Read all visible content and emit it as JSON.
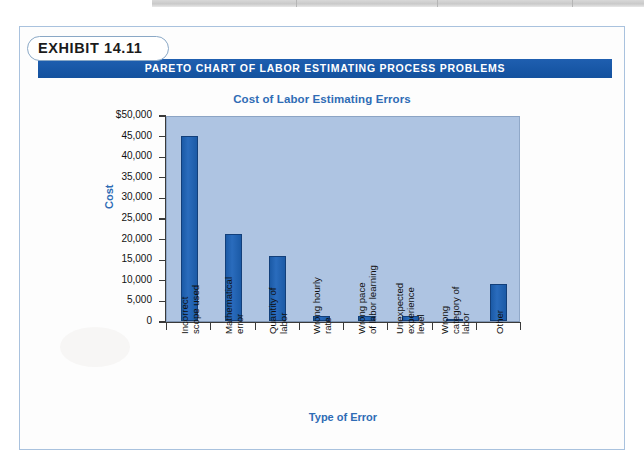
{
  "exhibit": {
    "label": "EXHIBIT 14.11",
    "banner_title": "PARETO CHART OF LABOR ESTIMATING PROCESS PROBLEMS",
    "banner_color": "#1857a6",
    "accent_color": "#2f6cb5"
  },
  "chart_data": {
    "type": "bar",
    "title": "Cost of Labor Estimating Errors",
    "xlabel": "Type of Error",
    "ylabel": "Cost",
    "ylim": [
      0,
      50000
    ],
    "ytick_labels": [
      "$50,000",
      "45,000",
      "40,000",
      "35,000",
      "30,000",
      "25,000",
      "20,000",
      "15,000",
      "10,000",
      "5,000",
      "0"
    ],
    "ytick_values": [
      50000,
      45000,
      40000,
      35000,
      30000,
      25000,
      20000,
      15000,
      10000,
      5000,
      0
    ],
    "grid": false,
    "legend": "none",
    "bar_color": "#1b5aa6",
    "plot_background": "#aec4e2",
    "categories": [
      "Incorrect scope used",
      "Mathematical error",
      "Quantity of labor",
      "Wrong hourly rate",
      "Wrong pace of labor learning",
      "Unexpected experience level",
      "Wrong category of labor",
      "Other"
    ],
    "category_lines": [
      [
        "Incorrect",
        "scope used"
      ],
      [
        "Mathematical",
        "error"
      ],
      [
        "Quantity of",
        "labor"
      ],
      [
        "Wrong hourly",
        "rate"
      ],
      [
        "Wrong pace",
        "of labor learning"
      ],
      [
        "Unexpected",
        "experience",
        "level"
      ],
      [
        "Wrong",
        "category of",
        "labor"
      ],
      [
        "Other"
      ]
    ],
    "values": [
      45000,
      21000,
      15800,
      1200,
      1100,
      1300,
      400,
      9000
    ]
  }
}
